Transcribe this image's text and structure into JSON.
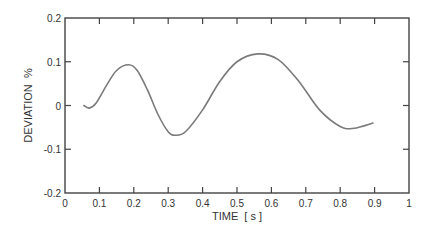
{
  "chart_data": {
    "type": "line",
    "title": "",
    "xlabel": "TIME  [ s ]",
    "ylabel": "DEVIATION  %",
    "xlim": [
      0,
      1
    ],
    "ylim": [
      -0.2,
      0.2
    ],
    "x_ticks": [
      0,
      0.1,
      0.2,
      0.3,
      0.4,
      0.5,
      0.6,
      0.7,
      0.8,
      0.9,
      1
    ],
    "x_tick_labels": [
      "0",
      "0.1",
      "0.2",
      "0.3",
      "0.4",
      "0.5",
      "0.6",
      "0.7",
      "0.8",
      "0.9",
      "1"
    ],
    "y_ticks": [
      0.2,
      0.1,
      0,
      -0.1,
      -0.2
    ],
    "y_tick_labels": [
      "0.2",
      "0.1",
      "0",
      "-0.1",
      "-0.2"
    ],
    "grid": false,
    "legend": null,
    "series": [
      {
        "name": "deviation",
        "color": "#7a7a7a",
        "x": [
          0.055,
          0.07,
          0.09,
          0.12,
          0.15,
          0.185,
          0.21,
          0.24,
          0.27,
          0.3,
          0.32,
          0.35,
          0.4,
          0.45,
          0.5,
          0.56,
          0.62,
          0.68,
          0.74,
          0.8,
          0.84,
          0.895
        ],
        "y": [
          0.0,
          -0.006,
          0.005,
          0.045,
          0.08,
          0.093,
          0.08,
          0.035,
          -0.02,
          -0.06,
          -0.068,
          -0.06,
          -0.01,
          0.055,
          0.1,
          0.118,
          0.105,
          0.055,
          -0.01,
          -0.048,
          -0.052,
          -0.04
        ]
      }
    ]
  },
  "colors": {
    "axis": "#444444",
    "line": "#7a7a7a",
    "text": "#333333"
  }
}
